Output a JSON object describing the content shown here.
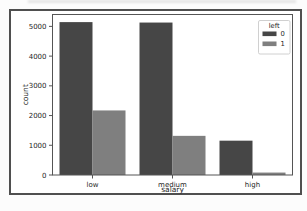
{
  "figure": {
    "kind": "matplotlib-bar-chart-screenshot",
    "background": "#ffffff",
    "border_color": "#4f4f4f"
  },
  "colors": {
    "axis": "#555555",
    "text": "#262626",
    "bar_dark": "#464646",
    "bar_light": "#7f7f7f",
    "legend_border": "#c4c4c4",
    "legend_background": "#ffffff",
    "page_background": "#fcfcfc"
  },
  "chart_data": {
    "type": "bar",
    "title": "",
    "xlabel": "salary",
    "ylabel": "count",
    "categories": [
      "low",
      "medium",
      "high"
    ],
    "series": [
      {
        "name": "0",
        "color": "#464646",
        "values": [
          5144,
          5129,
          1155
        ]
      },
      {
        "name": "1",
        "color": "#7f7f7f",
        "values": [
          2172,
          1317,
          82
        ]
      }
    ],
    "legend": {
      "title": "left",
      "position": "upper right"
    },
    "ylim": [
      0,
      5400
    ],
    "yticks": [
      0,
      1000,
      2000,
      3000,
      4000,
      5000
    ],
    "grid": false
  }
}
